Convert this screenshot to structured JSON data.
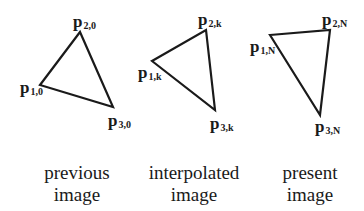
{
  "triangles": [
    {
      "id": "previous",
      "points": [
        [
          40,
          85
        ],
        [
          80,
          32
        ],
        [
          113,
          107
        ]
      ],
      "labels": [
        {
          "main": "p",
          "sub": "1,0",
          "x": 20,
          "y": 79
        },
        {
          "main": "p",
          "sub": "2,0",
          "x": 73,
          "y": 13
        },
        {
          "main": "p",
          "sub": "3,0",
          "x": 108,
          "y": 112
        }
      ],
      "caption": {
        "line1": "previous",
        "line2": "image"
      }
    },
    {
      "id": "interpolated",
      "points": [
        [
          152,
          61
        ],
        [
          206,
          30
        ],
        [
          215,
          110
        ]
      ],
      "labels": [
        {
          "main": "p",
          "sub": "1,k",
          "x": 138,
          "y": 64
        },
        {
          "main": "p",
          "sub": "2,k",
          "x": 198,
          "y": 11
        },
        {
          "main": "p",
          "sub": "3,k",
          "x": 210,
          "y": 115
        }
      ],
      "caption": {
        "line1": "interpolated",
        "line2": "image"
      }
    },
    {
      "id": "present",
      "points": [
        [
          270,
          35
        ],
        [
          330,
          30
        ],
        [
          320,
          115
        ]
      ],
      "labels": [
        {
          "main": "p",
          "sub": "1,N",
          "x": 250,
          "y": 38
        },
        {
          "main": "p",
          "sub": "2,N",
          "x": 322,
          "y": 11
        },
        {
          "main": "p",
          "sub": "3,N",
          "x": 315,
          "y": 118
        }
      ],
      "caption": {
        "line1": "present",
        "line2": "image"
      }
    }
  ],
  "colors": {
    "stroke": "#1a1a1a",
    "background": "#ffffff"
  }
}
